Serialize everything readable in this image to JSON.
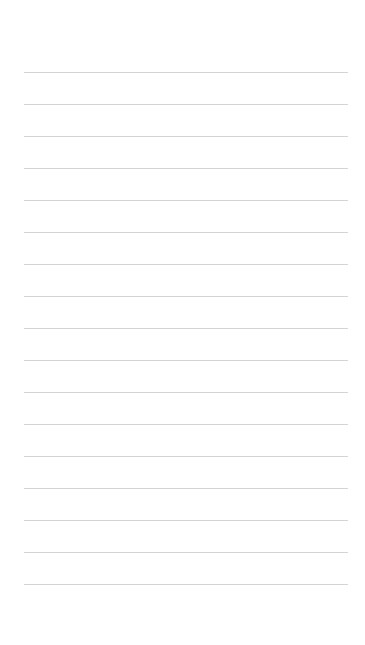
{
  "page": {
    "type": "blank lined paper",
    "background_color": "#ffffff",
    "line_color": "#d4d4d4",
    "line_count": 17,
    "first_line_y": 72,
    "line_spacing": 32,
    "line_left": 24,
    "line_width": 324
  }
}
